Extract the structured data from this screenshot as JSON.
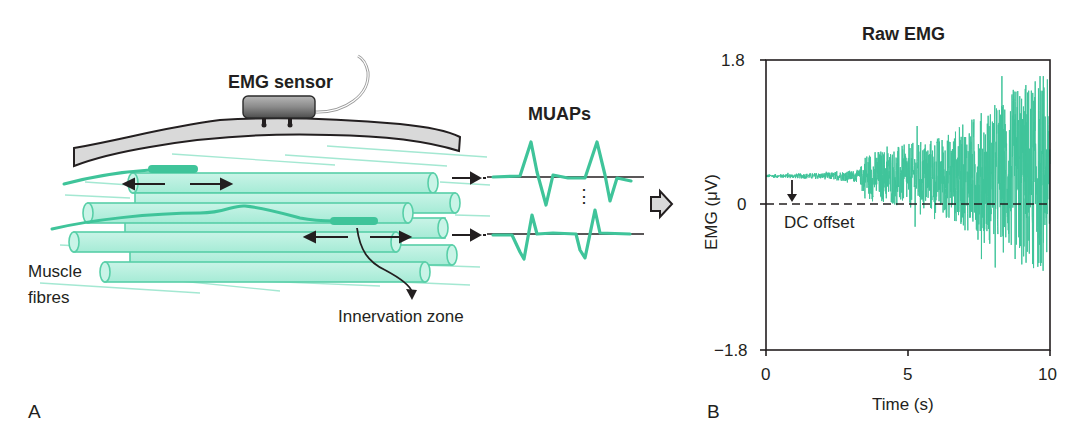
{
  "panel_a": {
    "letter": "A",
    "sensor_label": "EMG sensor",
    "muaps_label": "MUAPs",
    "muscle_label_line1": "Muscle",
    "muscle_label_line2": "fibres",
    "innervation_label": "Innervation zone",
    "ellipsis": "⋮"
  },
  "panel_b": {
    "letter": "B"
  },
  "colors": {
    "emg_green": "#3fc49a",
    "fibre_fill": "#b8efe0",
    "fibre_stroke": "#58cfa8",
    "skin_fill": "#d9d9d9",
    "ink": "#231f20"
  },
  "chart_data": {
    "type": "line",
    "title": "Raw EMG",
    "xlabel": "Time (s)",
    "ylabel": "EMG (μV)",
    "xlim": [
      0,
      10
    ],
    "ylim": [
      -1.8,
      1.8
    ],
    "xticks": [
      "0",
      "5",
      "10"
    ],
    "yticks": [
      "1.8",
      "0",
      "−1.8"
    ],
    "grid": false,
    "annotations": [
      {
        "text": "DC offset",
        "x": 0.9,
        "y": 0.36,
        "arrow_to_y": 0.0
      }
    ],
    "series": [
      {
        "name": "Raw EMG",
        "description": "Noisy signal with DC offset ~0.36 μV; amplitude grows over time (quiet 0–3.3 s, then increasing)",
        "dc_offset": 0.36,
        "envelope": {
          "t": [
            0,
            2.0,
            3.3,
            3.5,
            5.0,
            6.5,
            7.5,
            8.5,
            9.0,
            10
          ],
          "amplitude": [
            0.02,
            0.04,
            0.08,
            0.3,
            0.4,
            0.55,
            0.8,
            1.0,
            1.2,
            1.2
          ]
        },
        "peaks": {
          "max": 1.6,
          "min": -1.5
        }
      },
      {
        "name": "Zero reference (dashed)",
        "x": [
          0,
          10
        ],
        "y": [
          0,
          0
        ]
      }
    ]
  }
}
